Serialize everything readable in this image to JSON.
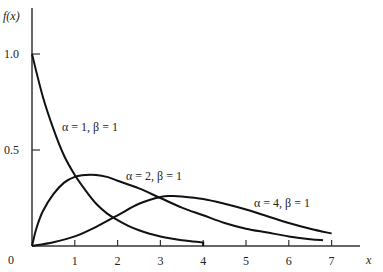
{
  "chart_data": {
    "type": "line",
    "title": "",
    "xlabel": "x",
    "ylabel": "f(x)",
    "xlim": [
      0,
      8
    ],
    "ylim": [
      0,
      1.2
    ],
    "grid": false,
    "legend": "inline labels",
    "x_ticks": [
      "1",
      "2",
      "3",
      "4",
      "5",
      "6",
      "7"
    ],
    "y_ticks": [
      "0",
      "0.5",
      "1.0"
    ],
    "series": [
      {
        "name": "α = 1, β = 1",
        "x": [
          0,
          0.25,
          0.5,
          0.75,
          1.0,
          1.25,
          1.5,
          1.75,
          2.0,
          2.25,
          2.5,
          2.75,
          3.0,
          3.25,
          3.5,
          3.75,
          4.0
        ],
        "values": [
          1.0,
          0.78,
          0.61,
          0.47,
          0.37,
          0.29,
          0.22,
          0.17,
          0.135,
          0.105,
          0.082,
          0.064,
          0.05,
          0.039,
          0.03,
          0.024,
          0.018
        ],
        "note": "curve truncated at x = 4 with a vertical drop to the axis"
      },
      {
        "name": "α = 2, β = 1",
        "x": [
          0,
          0.1,
          0.25,
          0.5,
          0.75,
          1.0,
          1.25,
          1.5,
          1.75,
          2.0,
          2.5,
          3.0,
          3.5,
          4.0,
          4.5,
          5.0,
          5.5,
          6.0,
          6.5,
          6.8
        ],
        "values": [
          0,
          0.09,
          0.18,
          0.27,
          0.33,
          0.36,
          0.37,
          0.37,
          0.36,
          0.34,
          0.3,
          0.25,
          0.2,
          0.16,
          0.12,
          0.09,
          0.07,
          0.05,
          0.035,
          0.03
        ]
      },
      {
        "name": "α = 4, β = 1",
        "x": [
          0,
          0.5,
          1.0,
          1.5,
          2.0,
          2.5,
          3.0,
          3.25,
          3.5,
          4.0,
          4.5,
          5.0,
          5.5,
          6.0,
          6.5,
          7.0
        ],
        "values": [
          0,
          0.02,
          0.05,
          0.1,
          0.16,
          0.22,
          0.255,
          0.26,
          0.258,
          0.245,
          0.22,
          0.19,
          0.155,
          0.12,
          0.09,
          0.065
        ]
      }
    ],
    "annotations": [
      {
        "text": "α = 1, β = 1",
        "x": 1.1,
        "y": 0.68
      },
      {
        "text": "α = 2, β = 1",
        "x": 2.2,
        "y": 0.36
      },
      {
        "text": "α = 4, β = 1",
        "x": 4.8,
        "y": 0.22
      }
    ]
  },
  "axis": {
    "ylabel": "f(x)",
    "xlabel": "x",
    "origin": "0",
    "y_ticks": [
      {
        "v": 1.0,
        "label": "1.0"
      },
      {
        "v": 0.5,
        "label": "0.5"
      }
    ],
    "x_ticks": [
      {
        "v": 1,
        "label": "1"
      },
      {
        "v": 2,
        "label": "2"
      },
      {
        "v": 3,
        "label": "3"
      },
      {
        "v": 4,
        "label": "4"
      },
      {
        "v": 5,
        "label": "5"
      },
      {
        "v": 6,
        "label": "6"
      },
      {
        "v": 7,
        "label": "7"
      }
    ]
  },
  "labels": {
    "s1": "α = 1, β = 1",
    "s2": "α = 2, β = 1",
    "s3": "α = 4, β = 1"
  },
  "colors": {
    "line": "#111111",
    "axis": "#333333",
    "background": "#ffffff"
  }
}
